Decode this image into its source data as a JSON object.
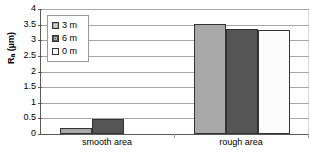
{
  "chart_data": {
    "type": "bar",
    "title": "",
    "xlabel": "",
    "ylabel": "Ra (µm)",
    "ylabel_base": "R",
    "ylabel_sub": "a",
    "ylabel_unit": " (µm)",
    "categories": [
      "smooth area",
      "rough area"
    ],
    "series": [
      {
        "name": "3 m",
        "values": [
          0.2,
          3.53
        ],
        "color": "#a8a8a8"
      },
      {
        "name": "6 m",
        "values": [
          0.47,
          3.36
        ],
        "color": "#555555"
      },
      {
        "name": "0 m",
        "values": [
          0.0,
          3.32
        ],
        "color": "#fcfcfc"
      }
    ],
    "ylim": [
      0,
      4
    ],
    "y_ticks": [
      "0",
      "0.5",
      "1",
      "1.5",
      "2",
      "2.5",
      "3",
      "3.5",
      "4"
    ],
    "y_tick_values": [
      0,
      0.5,
      1,
      1.5,
      2,
      2.5,
      3,
      3.5,
      4
    ],
    "grid": true,
    "legend_position": "inside-top-left",
    "bar_border_color": "#333333",
    "grid_color": "#a6a6a6",
    "axis_color": "#5a5a5a",
    "background": "#ffffff"
  }
}
